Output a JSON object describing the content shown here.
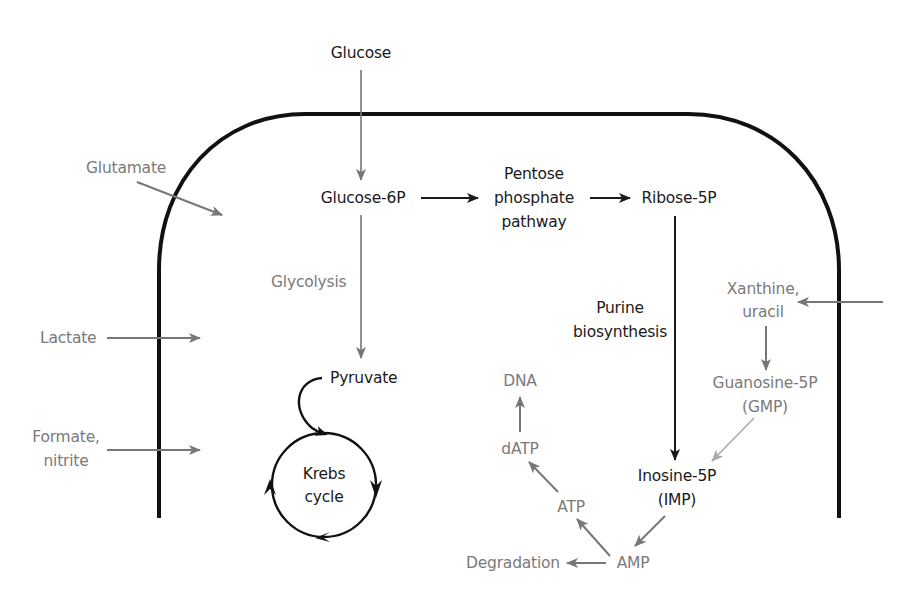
{
  "diagram": {
    "type": "metabolic-pathway",
    "colors": {
      "membrane": "#111111",
      "main_pathway": "#1a1a1a",
      "secondary": "#777777",
      "light_arrow": "#aaaaaa"
    },
    "nodes": {
      "glucose": "Glucose",
      "glucose_6p": "Glucose-6P",
      "pentose_line1": "Pentose",
      "pentose_line2": "phosphate",
      "pentose_line3": "pathway",
      "ribose_5p": "Ribose-5P",
      "glutamate": "Glutamate",
      "glycolysis": "Glycolysis",
      "lactate": "Lactate",
      "formate_line1": "Formate,",
      "formate_line2": "nitrite",
      "pyruvate": "Pyruvate",
      "krebs_line1": "Krebs",
      "krebs_line2": "cycle",
      "purine_line1": "Purine",
      "purine_line2": "biosynthesis",
      "xanthine_line1": "Xanthine,",
      "xanthine_line2": "uracil",
      "gmp_line1": "Guanosine-5P",
      "gmp_line2": "(GMP)",
      "imp_line1": "Inosine-5P",
      "imp_line2": "(IMP)",
      "dna": "DNA",
      "datp": "dATP",
      "atp": "ATP",
      "amp": "AMP",
      "degradation": "Degradation"
    },
    "edges": [
      {
        "from": "Glucose",
        "to": "Glucose-6P"
      },
      {
        "from": "Glucose-6P",
        "to": "Pentose phosphate pathway"
      },
      {
        "from": "Pentose phosphate pathway",
        "to": "Ribose-5P"
      },
      {
        "from": "Ribose-5P",
        "to": "Inosine-5P (IMP)",
        "label": "Purine biosynthesis"
      },
      {
        "from": "Glucose-6P",
        "to": "Pyruvate",
        "label": "Glycolysis"
      },
      {
        "from": "Pyruvate",
        "to": "Krebs cycle"
      },
      {
        "from": "Glutamate",
        "to": "cell"
      },
      {
        "from": "Lactate",
        "to": "cell"
      },
      {
        "from": "Formate, nitrite",
        "to": "cell"
      },
      {
        "from": "outside",
        "to": "Xanthine, uracil"
      },
      {
        "from": "Xanthine, uracil",
        "to": "Guanosine-5P (GMP)"
      },
      {
        "from": "Guanosine-5P (GMP)",
        "to": "Inosine-5P (IMP)"
      },
      {
        "from": "Inosine-5P (IMP)",
        "to": "AMP"
      },
      {
        "from": "AMP",
        "to": "ATP"
      },
      {
        "from": "AMP",
        "to": "Degradation"
      },
      {
        "from": "ATP",
        "to": "dATP"
      },
      {
        "from": "dATP",
        "to": "DNA"
      }
    ]
  }
}
